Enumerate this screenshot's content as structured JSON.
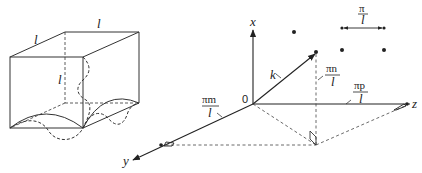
{
  "figure": {
    "left_panel": {
      "description": "Cubic box of side l with standing waves along edges",
      "edge_labels": [
        "l",
        "l",
        "l"
      ]
    },
    "right_panel": {
      "description": "k-space lattice with wavevector k",
      "origin_label": "0",
      "axes": {
        "x": "x",
        "y": "y",
        "z": "z"
      },
      "vector_label": "k",
      "components": {
        "x": {
          "num": "πn",
          "den": "l"
        },
        "y": {
          "num": "πm",
          "den": "l"
        },
        "z": {
          "num": "πp",
          "den": "l"
        }
      },
      "spacing": {
        "num": "π",
        "den": "l"
      }
    }
  }
}
